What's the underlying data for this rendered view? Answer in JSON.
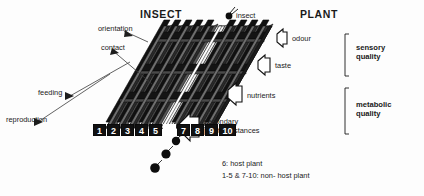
{
  "figure": {
    "title_left": "INSECT",
    "title_right": "PLANT",
    "insect_marker_label": "insect"
  },
  "insect_side_labels": [
    {
      "id": "orientation",
      "text": "orientation"
    },
    {
      "id": "contact",
      "text": "contact"
    },
    {
      "id": "feeding",
      "text": "feeding"
    },
    {
      "id": "reproduction",
      "text": "reproduction"
    }
  ],
  "plant_side_labels": [
    {
      "id": "odour",
      "text": "odour"
    },
    {
      "id": "taste",
      "text": "taste"
    },
    {
      "id": "nutrients",
      "text": "nutrients"
    },
    {
      "id": "secondary",
      "text": "secondary",
      "text2": "plant substances"
    }
  ],
  "quality_groups": [
    {
      "id": "sensory",
      "line1": "sensory",
      "line2": "quality"
    },
    {
      "id": "metabolic",
      "line1": "metabolic",
      "line2": "quality"
    }
  ],
  "filter_boxes": [
    {
      "number": "1",
      "host": false
    },
    {
      "number": "2",
      "host": false
    },
    {
      "number": "3",
      "host": false
    },
    {
      "number": "4",
      "host": false
    },
    {
      "number": "5",
      "host": false
    },
    {
      "number": "6",
      "host": true
    },
    {
      "number": "7",
      "host": false
    },
    {
      "number": "8",
      "host": false
    },
    {
      "number": "9",
      "host": false
    },
    {
      "number": "10",
      "host": false
    }
  ],
  "caption": {
    "line1": "6: host plant",
    "line2": "1-5 & 7-10:  non- host plant"
  },
  "colors": {
    "ink": "#1a1a1a",
    "panel_dark": "#161616",
    "panel_mid": "#3a3a3a",
    "panel_light": "#f2f2f2",
    "background": "#fdfdfd"
  }
}
